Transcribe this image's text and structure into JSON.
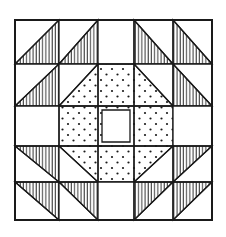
{
  "diagram": {
    "title": "",
    "type": "quilt-block",
    "grid_size": 5,
    "colors": {
      "background": "#ffffff",
      "ink": "#1a1a1a"
    },
    "patterns": {
      "striped": "vertical-line hatching",
      "dotted": "dot stipple",
      "plain": "white"
    },
    "cells": [
      [
        "hst-br-striped",
        "hst-br-striped",
        "plain",
        "hst-bl-striped",
        "hst-bl-striped"
      ],
      [
        "hst-br-striped",
        "corner-br-dotted",
        "dotted",
        "corner-bl-dotted",
        "hst-bl-striped"
      ],
      [
        "plain",
        "dotted",
        "center-square",
        "dotted",
        "plain"
      ],
      [
        "hst-tr-striped",
        "corner-tr-dotted",
        "dotted",
        "corner-tl-dotted",
        "hst-tl-striped"
      ],
      [
        "hst-tr-striped",
        "hst-tr-striped",
        "plain",
        "hst-tl-striped",
        "hst-tl-striped"
      ]
    ]
  }
}
